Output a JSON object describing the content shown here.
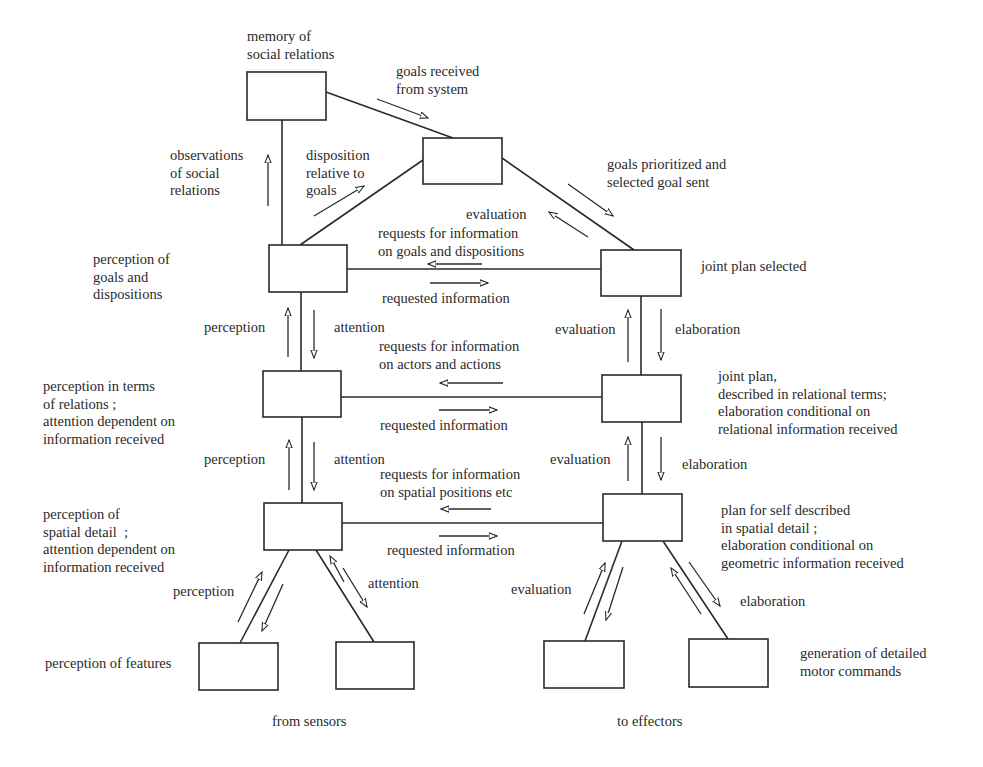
{
  "colors": {
    "ink": "#2a2a2a",
    "background": "#ffffff"
  },
  "boxes": [
    {
      "id": "memory",
      "name": "memory-of-social-relations-box",
      "x": 247,
      "y": 72,
      "w": 79,
      "h": 48
    },
    {
      "id": "goal",
      "name": "goal-selection-box",
      "x": 423,
      "y": 138,
      "w": 79,
      "h": 46
    },
    {
      "id": "perc_goals",
      "name": "perception-of-goals-box",
      "x": 269,
      "y": 245,
      "w": 78,
      "h": 47
    },
    {
      "id": "joint_plan",
      "name": "joint-plan-selected-box",
      "x": 601,
      "y": 250,
      "w": 80,
      "h": 46
    },
    {
      "id": "perc_rel",
      "name": "perception-relations-box",
      "x": 263,
      "y": 371,
      "w": 78,
      "h": 46
    },
    {
      "id": "plan_rel",
      "name": "joint-plan-relational-box",
      "x": 602,
      "y": 375,
      "w": 79,
      "h": 47
    },
    {
      "id": "perc_spatial",
      "name": "perception-spatial-box",
      "x": 264,
      "y": 503,
      "w": 78,
      "h": 47
    },
    {
      "id": "plan_spatial",
      "name": "plan-for-self-spatial-box",
      "x": 603,
      "y": 494,
      "w": 79,
      "h": 47
    },
    {
      "id": "features_a",
      "name": "feature-perception-box-left",
      "x": 199,
      "y": 643,
      "w": 79,
      "h": 47
    },
    {
      "id": "features_b",
      "name": "feature-perception-box-right",
      "x": 336,
      "y": 642,
      "w": 78,
      "h": 47
    },
    {
      "id": "motor_a",
      "name": "motor-command-box-left",
      "x": 544,
      "y": 641,
      "w": 80,
      "h": 47
    },
    {
      "id": "motor_b",
      "name": "motor-command-box-right",
      "x": 689,
      "y": 639,
      "w": 79,
      "h": 48
    }
  ],
  "connectors": [
    {
      "name": "memory-to-goal-line",
      "x1": 326,
      "y1": 92,
      "x2": 453,
      "y2": 138
    },
    {
      "name": "memory-to-perception-line",
      "x1": 282,
      "y1": 120,
      "x2": 282,
      "y2": 245
    },
    {
      "name": "perception-to-goal-line",
      "x1": 300,
      "y1": 245,
      "x2": 423,
      "y2": 160
    },
    {
      "name": "goal-to-joint-plan-line",
      "x1": 502,
      "y1": 158,
      "x2": 634,
      "y2": 250
    },
    {
      "name": "goals-to-joint-plan-line",
      "x1": 347,
      "y1": 269,
      "x2": 601,
      "y2": 269
    },
    {
      "name": "left-upper-vertical-line",
      "x1": 301,
      "y1": 292,
      "x2": 301,
      "y2": 371
    },
    {
      "name": "right-upper-vertical-line",
      "x1": 641,
      "y1": 296,
      "x2": 641,
      "y2": 375
    },
    {
      "name": "relations-horizontal-line",
      "x1": 341,
      "y1": 397,
      "x2": 602,
      "y2": 397
    },
    {
      "name": "left-lower-vertical-line",
      "x1": 302,
      "y1": 417,
      "x2": 302,
      "y2": 503
    },
    {
      "name": "right-lower-vertical-line",
      "x1": 642,
      "y1": 422,
      "x2": 642,
      "y2": 494
    },
    {
      "name": "spatial-horizontal-line",
      "x1": 342,
      "y1": 523,
      "x2": 603,
      "y2": 523
    },
    {
      "name": "spatial-to-features-left-line",
      "x1": 289,
      "y1": 550,
      "x2": 240,
      "y2": 643
    },
    {
      "name": "spatial-to-features-right-line",
      "x1": 316,
      "y1": 550,
      "x2": 374,
      "y2": 642
    },
    {
      "name": "plan-to-motor-left-line",
      "x1": 622,
      "y1": 541,
      "x2": 585,
      "y2": 641
    },
    {
      "name": "plan-to-motor-right-line",
      "x1": 663,
      "y1": 541,
      "x2": 728,
      "y2": 639
    }
  ],
  "arrows": [
    {
      "name": "goals-received-arrow",
      "x1": 377,
      "y1": 99,
      "x2": 428,
      "y2": 118
    },
    {
      "name": "observations-arrow",
      "x1": 268,
      "y1": 206,
      "x2": 268,
      "y2": 155
    },
    {
      "name": "disposition-arrow",
      "x1": 314,
      "y1": 216,
      "x2": 364,
      "y2": 186
    },
    {
      "name": "goals-prioritized-arrow",
      "x1": 568,
      "y1": 184,
      "x2": 613,
      "y2": 216
    },
    {
      "name": "evaluation-top-arrow",
      "x1": 588,
      "y1": 237,
      "x2": 549,
      "y2": 212
    },
    {
      "name": "requests-goals-arrow",
      "x1": 482,
      "y1": 264,
      "x2": 428,
      "y2": 264
    },
    {
      "name": "requested-info-top-arrow",
      "x1": 430,
      "y1": 283,
      "x2": 488,
      "y2": 283
    },
    {
      "name": "perception-upper-arrow",
      "x1": 288,
      "y1": 357,
      "x2": 288,
      "y2": 308
    },
    {
      "name": "attention-upper-arrow",
      "x1": 314,
      "y1": 310,
      "x2": 314,
      "y2": 358
    },
    {
      "name": "evaluation-upper-arrow",
      "x1": 628,
      "y1": 362,
      "x2": 628,
      "y2": 310
    },
    {
      "name": "elaboration-upper-arrow",
      "x1": 661,
      "y1": 309,
      "x2": 661,
      "y2": 360
    },
    {
      "name": "requests-actors-arrow",
      "x1": 503,
      "y1": 383,
      "x2": 440,
      "y2": 383
    },
    {
      "name": "requested-info-middle-arrow",
      "x1": 439,
      "y1": 410,
      "x2": 497,
      "y2": 410
    },
    {
      "name": "perception-lower-arrow",
      "x1": 289,
      "y1": 490,
      "x2": 289,
      "y2": 440
    },
    {
      "name": "attention-lower-arrow",
      "x1": 314,
      "y1": 442,
      "x2": 314,
      "y2": 490
    },
    {
      "name": "evaluation-lower-arrow",
      "x1": 628,
      "y1": 481,
      "x2": 628,
      "y2": 437
    },
    {
      "name": "elaboration-lower-arrow",
      "x1": 661,
      "y1": 437,
      "x2": 661,
      "y2": 480
    },
    {
      "name": "requests-spatial-arrow",
      "x1": 491,
      "y1": 509,
      "x2": 441,
      "y2": 509
    },
    {
      "name": "requested-info-bottom-arrow",
      "x1": 439,
      "y1": 536,
      "x2": 497,
      "y2": 536
    },
    {
      "name": "perception-features-arrow",
      "x1": 238,
      "y1": 622,
      "x2": 262,
      "y2": 572
    },
    {
      "name": "attention-features-up-arrow",
      "x1": 283,
      "y1": 584,
      "x2": 262,
      "y2": 631
    },
    {
      "name": "attention-features-down-arrow",
      "x1": 344,
      "y1": 582,
      "x2": 330,
      "y2": 556
    },
    {
      "name": "attention-features-right-arrow",
      "x1": 343,
      "y1": 568,
      "x2": 367,
      "y2": 607
    },
    {
      "name": "evaluation-motor-arrow",
      "x1": 584,
      "y1": 614,
      "x2": 605,
      "y2": 563
    },
    {
      "name": "evaluation-motor-down-arrow",
      "x1": 623,
      "y1": 567,
      "x2": 606,
      "y2": 620
    },
    {
      "name": "elaboration-motor-up-arrow",
      "x1": 701,
      "y1": 614,
      "x2": 671,
      "y2": 568
    },
    {
      "name": "elaboration-motor-down-arrow",
      "x1": 689,
      "y1": 562,
      "x2": 720,
      "y2": 606
    }
  ],
  "labels": [
    {
      "name": "label-memory-of-social-relations",
      "x": 247,
      "y": 28,
      "align": "left",
      "text": "memory of\nsocial relations"
    },
    {
      "name": "label-goals-received",
      "x": 396,
      "y": 63,
      "align": "left",
      "text": "goals received\nfrom system"
    },
    {
      "name": "label-observations",
      "x": 170,
      "y": 147,
      "align": "left",
      "text": "observations\nof social\nrelations"
    },
    {
      "name": "label-disposition",
      "x": 306,
      "y": 147,
      "align": "left",
      "text": "disposition\nrelative to\ngoals"
    },
    {
      "name": "label-goals-prioritized",
      "x": 607,
      "y": 156,
      "align": "left",
      "text": "goals prioritized and\nselected goal sent"
    },
    {
      "name": "label-evaluation-top",
      "x": 466,
      "y": 206,
      "align": "left",
      "text": "evaluation"
    },
    {
      "name": "label-requests-goals",
      "x": 378,
      "y": 225,
      "align": "left",
      "text": "requests for information\non goals and dispositions"
    },
    {
      "name": "label-perception-of-goals",
      "x": 93,
      "y": 251,
      "align": "left",
      "text": "perception of\ngoals and\ndispositions"
    },
    {
      "name": "label-joint-plan-selected",
      "x": 701,
      "y": 258,
      "align": "left",
      "text": "joint plan selected"
    },
    {
      "name": "label-requested-info-top",
      "x": 382,
      "y": 290,
      "align": "left",
      "text": "requested information"
    },
    {
      "name": "label-perception-upper",
      "x": 204,
      "y": 319,
      "align": "left",
      "text": "perception"
    },
    {
      "name": "label-attention-upper",
      "x": 334,
      "y": 319,
      "align": "left",
      "text": "attention"
    },
    {
      "name": "label-evaluation-upper",
      "x": 555,
      "y": 321,
      "align": "left",
      "text": "evaluation"
    },
    {
      "name": "label-elaboration-upper",
      "x": 675,
      "y": 321,
      "align": "left",
      "text": "elaboration"
    },
    {
      "name": "label-requests-actors",
      "x": 379,
      "y": 338,
      "align": "left",
      "text": "requests for information\non actors and actions"
    },
    {
      "name": "label-joint-plan-relational",
      "x": 718,
      "y": 368,
      "align": "left",
      "text": "joint plan,\ndescribed in relational terms;\nelaboration conditional on\nrelational information received"
    },
    {
      "name": "label-perception-relations",
      "x": 43,
      "y": 378,
      "align": "left",
      "text": "perception in terms\nof relations ;\nattention dependent on\ninformation received"
    },
    {
      "name": "label-requested-info-middle",
      "x": 380,
      "y": 417,
      "align": "left",
      "text": "requested information"
    },
    {
      "name": "label-perception-lower",
      "x": 204,
      "y": 451,
      "align": "left",
      "text": "perception"
    },
    {
      "name": "label-attention-lower",
      "x": 334,
      "y": 451,
      "align": "left",
      "text": "attention"
    },
    {
      "name": "label-evaluation-lower",
      "x": 550,
      "y": 451,
      "align": "left",
      "text": "evaluation"
    },
    {
      "name": "label-elaboration-lower",
      "x": 682,
      "y": 456,
      "align": "left",
      "text": "elaboration"
    },
    {
      "name": "label-requests-spatial",
      "x": 380,
      "y": 466,
      "align": "left",
      "text": "requests for information\non spatial positions etc"
    },
    {
      "name": "label-plan-for-self",
      "x": 721,
      "y": 502,
      "align": "left",
      "text": "plan for self described\nin spatial detail ;\nelaboration conditional on\ngeometric information received"
    },
    {
      "name": "label-perception-spatial",
      "x": 43,
      "y": 506,
      "align": "left",
      "text": "perception of\nspatial detail  ;\nattention dependent on\ninformation received"
    },
    {
      "name": "label-requested-info-bottom",
      "x": 387,
      "y": 542,
      "align": "left",
      "text": "requested information"
    },
    {
      "name": "label-attention-features",
      "x": 368,
      "y": 575,
      "align": "left",
      "text": "attention"
    },
    {
      "name": "label-perception-features",
      "x": 173,
      "y": 583,
      "align": "left",
      "text": "perception"
    },
    {
      "name": "label-evaluation-motor",
      "x": 511,
      "y": 581,
      "align": "left",
      "text": "evaluation"
    },
    {
      "name": "label-elaboration-motor",
      "x": 740,
      "y": 593,
      "align": "left",
      "text": "elaboration"
    },
    {
      "name": "label-perception-of-features",
      "x": 45,
      "y": 655,
      "align": "left",
      "text": "perception of features"
    },
    {
      "name": "label-generation-motor",
      "x": 800,
      "y": 645,
      "align": "left",
      "text": "generation of detailed\nmotor commands"
    },
    {
      "name": "label-from-sensors",
      "x": 272,
      "y": 713,
      "align": "left",
      "text": "from sensors"
    },
    {
      "name": "label-to-effectors",
      "x": 617,
      "y": 713,
      "align": "left",
      "text": "to effectors"
    }
  ]
}
